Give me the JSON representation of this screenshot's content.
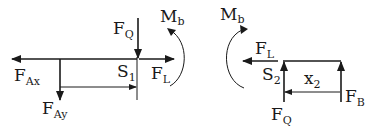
{
  "diagram": {
    "left_section": {
      "forces": [
        {
          "id": "F_Ax",
          "base": "F",
          "subscript": "Ax",
          "direction": "left"
        },
        {
          "id": "F_Ay",
          "base": "F",
          "subscript": "Ay",
          "direction": "down"
        },
        {
          "id": "F_Q",
          "base": "F",
          "subscript": "Q",
          "direction": "down"
        },
        {
          "id": "F_L",
          "base": "F",
          "subscript": "L",
          "direction": "right"
        }
      ],
      "moment": {
        "base": "M",
        "subscript": "b",
        "direction": "counterclockwise"
      },
      "point": {
        "base": "S",
        "subscript": "1"
      }
    },
    "right_section": {
      "forces": [
        {
          "id": "F_L",
          "base": "F",
          "subscript": "L",
          "direction": "left"
        },
        {
          "id": "F_Q",
          "base": "F",
          "subscript": "Q",
          "direction": "up"
        },
        {
          "id": "F_B",
          "base": "F",
          "subscript": "B",
          "direction": "up"
        }
      ],
      "moment": {
        "base": "M",
        "subscript": "b",
        "direction": "clockwise"
      },
      "point": {
        "base": "S",
        "subscript": "2"
      },
      "distance": {
        "base": "x",
        "subscript": "2"
      }
    }
  }
}
